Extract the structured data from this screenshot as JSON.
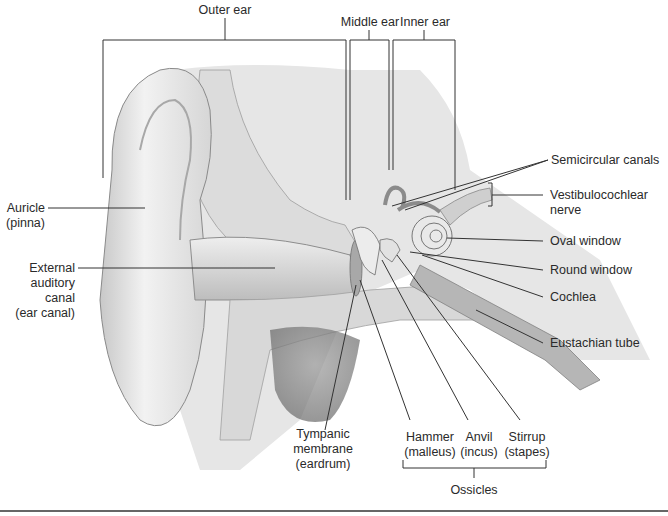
{
  "diagram": {
    "regions": [
      {
        "label": "Outer ear"
      },
      {
        "label": "Middle ear"
      },
      {
        "label": "Inner ear"
      }
    ],
    "labels_left": [
      {
        "line1": "Auricle",
        "line2": "(pinna)"
      },
      {
        "line1": "External",
        "line2": "auditory",
        "line3": "canal",
        "line4": "(ear canal)"
      }
    ],
    "labels_right": [
      {
        "line1": "Semicircular canals"
      },
      {
        "line1": "Vestibulocochlear",
        "line2": "nerve"
      },
      {
        "line1": "Oval window"
      },
      {
        "line1": "Round window"
      },
      {
        "line1": "Cochlea"
      },
      {
        "line1": "Eustachian tube"
      }
    ],
    "labels_bottom": [
      {
        "line1": "Tympanic",
        "line2": "membrane",
        "line3": "(eardrum)"
      },
      {
        "line1": "Hammer",
        "line2": "(malleus)"
      },
      {
        "line1": "Anvil",
        "line2": "(incus)"
      },
      {
        "line1": "Stirrup",
        "line2": "(stapes)"
      }
    ],
    "group_label": "Ossicles"
  }
}
